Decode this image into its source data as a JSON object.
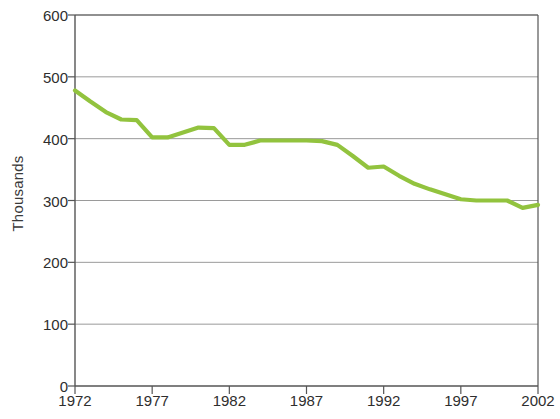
{
  "chart_data": {
    "type": "line",
    "title": "",
    "xlabel": "",
    "ylabel": "Thousands",
    "xlim": [
      1972,
      2002
    ],
    "ylim": [
      0,
      600
    ],
    "ytick_labels": [
      "600",
      "500",
      "400",
      "300",
      "200",
      "100",
      "0"
    ],
    "ytick_values": [
      600,
      500,
      400,
      300,
      200,
      100,
      0
    ],
    "xtick_labels": [
      "1972",
      "1977",
      "1982",
      "1987",
      "1992",
      "1997",
      "2002"
    ],
    "xtick_values": [
      1972,
      1977,
      1982,
      1987,
      1992,
      1997,
      2002
    ],
    "grid": "horizontal",
    "legend": "none",
    "series": [
      {
        "name": "Thousands",
        "color": "#92c33e",
        "x": [
          1972,
          1973,
          1974,
          1975,
          1976,
          1977,
          1978,
          1979,
          1980,
          1981,
          1982,
          1983,
          1984,
          1985,
          1986,
          1987,
          1988,
          1989,
          1990,
          1991,
          1992,
          1993,
          1994,
          1995,
          1996,
          1997,
          1998,
          1999,
          2000,
          2001,
          2002
        ],
        "values": [
          478,
          460,
          443,
          431,
          430,
          402,
          402,
          410,
          418,
          417,
          390,
          390,
          397,
          397,
          397,
          397,
          396,
          390,
          372,
          353,
          355,
          340,
          327,
          318,
          310,
          302,
          300,
          300,
          300,
          288,
          293
        ]
      }
    ]
  },
  "axis": {
    "line_color": "#555555",
    "grid_color": "#9a9a9a",
    "tick_color": "#555555"
  }
}
